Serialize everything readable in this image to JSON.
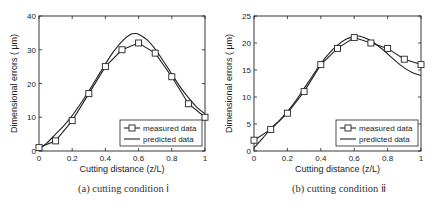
{
  "chart_data": [
    {
      "type": "line",
      "caption": "(a) cutting condition ⅰ",
      "xlabel": "Cutting distance (z/L)",
      "ylabel": "Dimensional errors ( μm)",
      "xlim": [
        0,
        1
      ],
      "ylim": [
        0,
        40
      ],
      "xticks": [
        "0",
        "0.2",
        "0.4",
        "0.6",
        "0.8",
        "1"
      ],
      "yticks": [
        "0",
        "10",
        "20",
        "30",
        "40"
      ],
      "grid": false,
      "legend_position": "bottom-right",
      "series": [
        {
          "name": "measured data",
          "marker": "square",
          "x": [
            0,
            0.1,
            0.2,
            0.3,
            0.4,
            0.5,
            0.6,
            0.7,
            0.8,
            0.9,
            1.0
          ],
          "y": [
            1,
            3,
            9,
            17,
            25,
            30,
            32,
            29,
            22,
            14,
            10
          ]
        },
        {
          "name": "predicted data",
          "marker": "none",
          "x": [
            0,
            0.05,
            0.1,
            0.15,
            0.2,
            0.25,
            0.3,
            0.35,
            0.4,
            0.45,
            0.5,
            0.55,
            0.58,
            0.6,
            0.65,
            0.7,
            0.75,
            0.8,
            0.85,
            0.9,
            0.95,
            1.0
          ],
          "y": [
            0.5,
            2.5,
            5,
            7.5,
            10.5,
            14,
            17.8,
            21.8,
            25.8,
            29.5,
            32.5,
            34.5,
            34.8,
            34.6,
            33,
            30.2,
            26.6,
            22.8,
            19,
            15.8,
            13,
            11
          ]
        }
      ]
    },
    {
      "type": "line",
      "caption": "(b) cutting condition ⅱ",
      "xlabel": "Cutting distance (z/L)",
      "ylabel": "Dimensional errors ( μm)",
      "xlim": [
        0,
        1
      ],
      "ylim": [
        0,
        25
      ],
      "xticks": [
        "0",
        "0.2",
        "0.4",
        "0.6",
        "0.8",
        "1"
      ],
      "yticks": [
        "0",
        "5",
        "10",
        "15",
        "20",
        "25"
      ],
      "grid": false,
      "legend_position": "bottom-right",
      "series": [
        {
          "name": "measured data",
          "marker": "square",
          "x": [
            0,
            0.1,
            0.2,
            0.3,
            0.4,
            0.5,
            0.6,
            0.7,
            0.8,
            0.9,
            1.0
          ],
          "y": [
            2,
            4,
            7,
            11,
            16,
            19,
            21,
            20,
            19,
            17,
            16
          ]
        },
        {
          "name": "predicted data",
          "marker": "none",
          "x": [
            0,
            0.05,
            0.1,
            0.15,
            0.2,
            0.25,
            0.3,
            0.35,
            0.4,
            0.45,
            0.5,
            0.55,
            0.6,
            0.62,
            0.65,
            0.7,
            0.75,
            0.8,
            0.85,
            0.9,
            0.95,
            1.0
          ],
          "y": [
            0.6,
            2.3,
            4.1,
            5.6,
            7.3,
            9.3,
            11.6,
            13.9,
            16.2,
            18.1,
            19.6,
            20.7,
            21.2,
            21.3,
            21.1,
            20.4,
            19.3,
            18,
            16.6,
            15.4,
            14.5,
            14
          ]
        }
      ]
    }
  ]
}
